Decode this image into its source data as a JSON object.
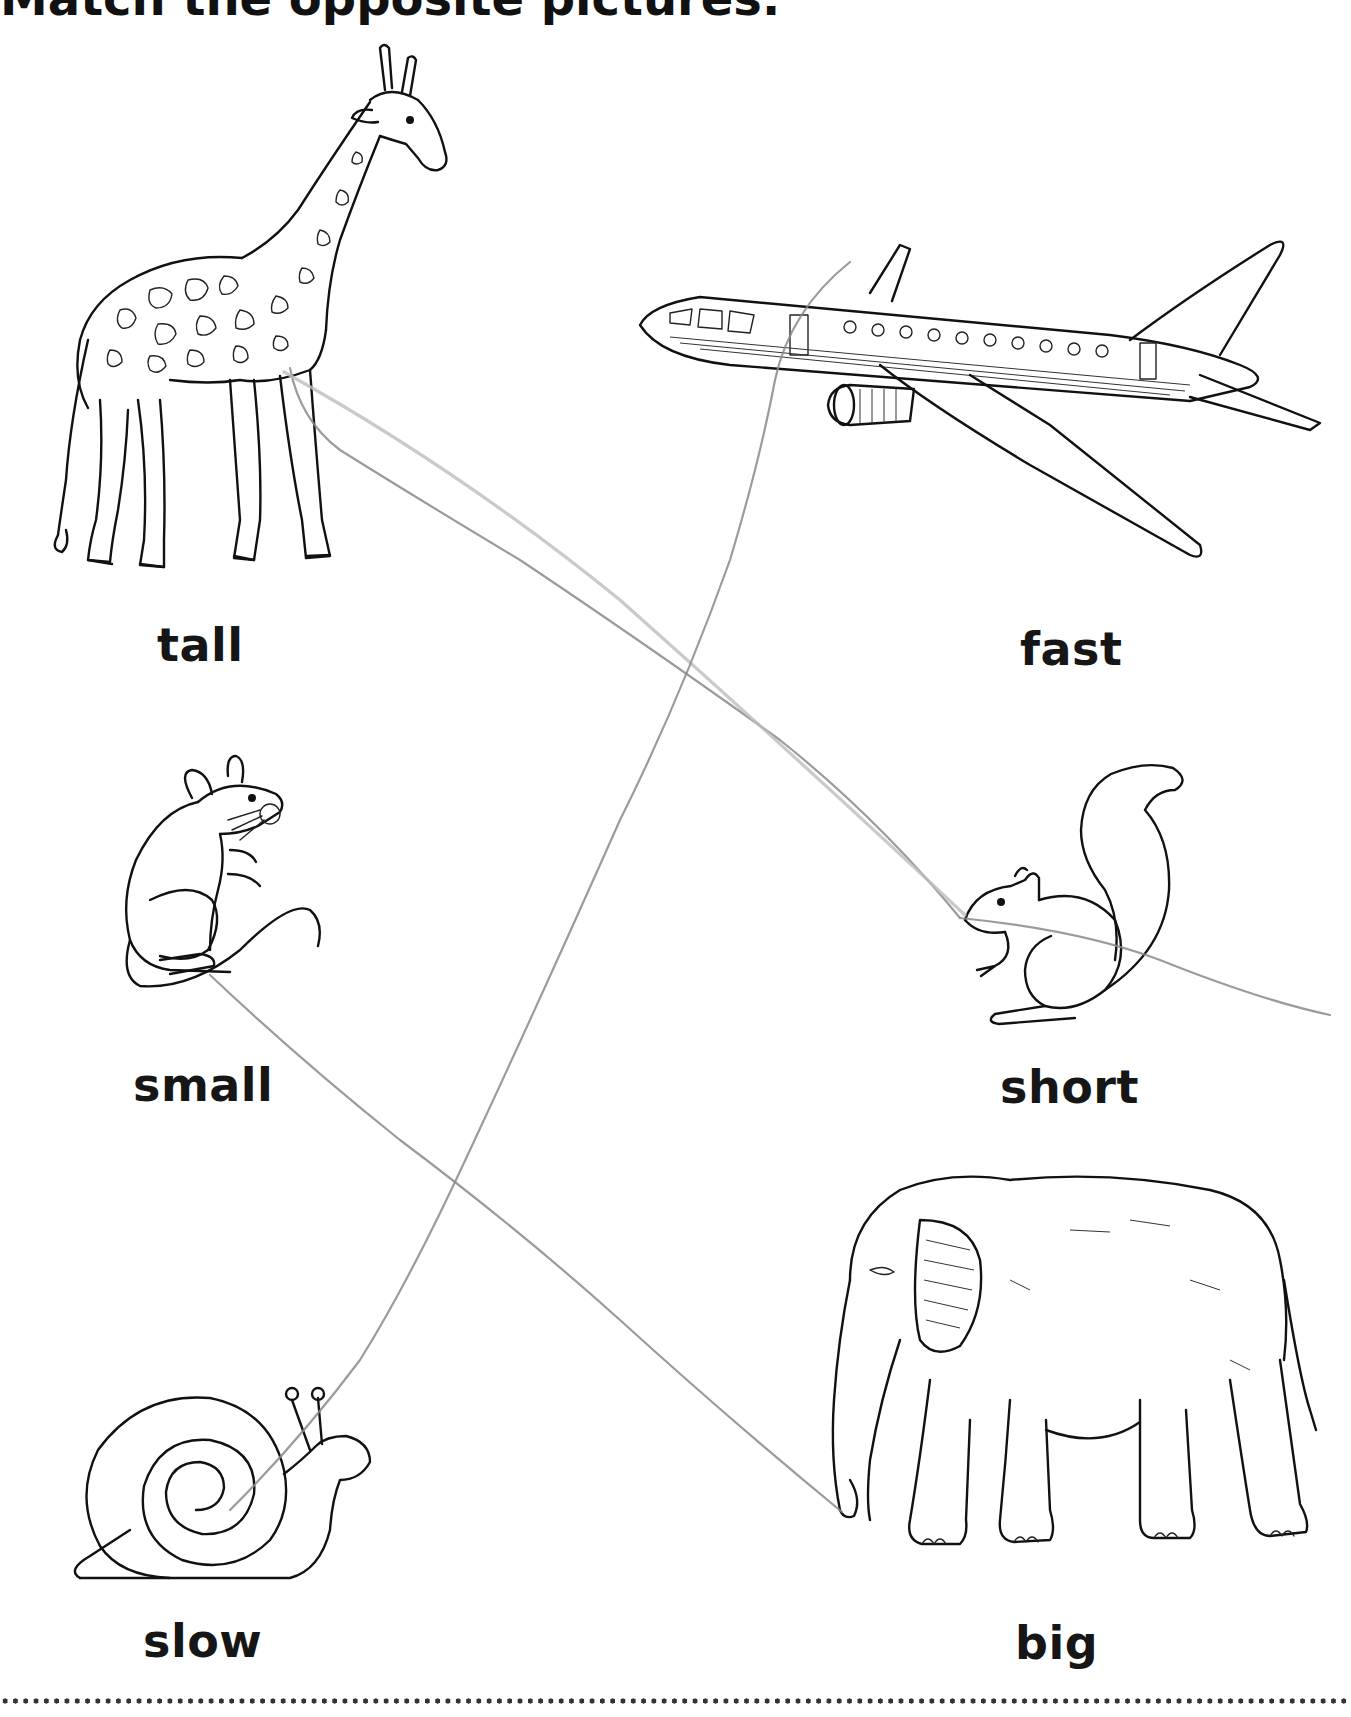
{
  "worksheet": {
    "title_partial": "Match the opposite pictures.",
    "pictures": [
      {
        "id": "giraffe",
        "label": "tall",
        "icon": "giraffe-drawing"
      },
      {
        "id": "airplane",
        "label": "fast",
        "icon": "airplane-drawing"
      },
      {
        "id": "mouse",
        "label": "small",
        "icon": "mouse-drawing"
      },
      {
        "id": "squirrel",
        "label": "short",
        "icon": "squirrel-drawing"
      },
      {
        "id": "snail",
        "label": "slow",
        "icon": "snail-drawing"
      },
      {
        "id": "elephant",
        "label": "big",
        "icon": "elephant-drawing"
      }
    ],
    "pencil_matches": [
      {
        "from": "tall",
        "to": "short"
      },
      {
        "from": "fast",
        "to": "slow"
      },
      {
        "from": "small",
        "to": "big"
      }
    ],
    "colors": {
      "ink": "#111111",
      "pencil": "#8a8a8a",
      "background": "#ffffff"
    }
  }
}
